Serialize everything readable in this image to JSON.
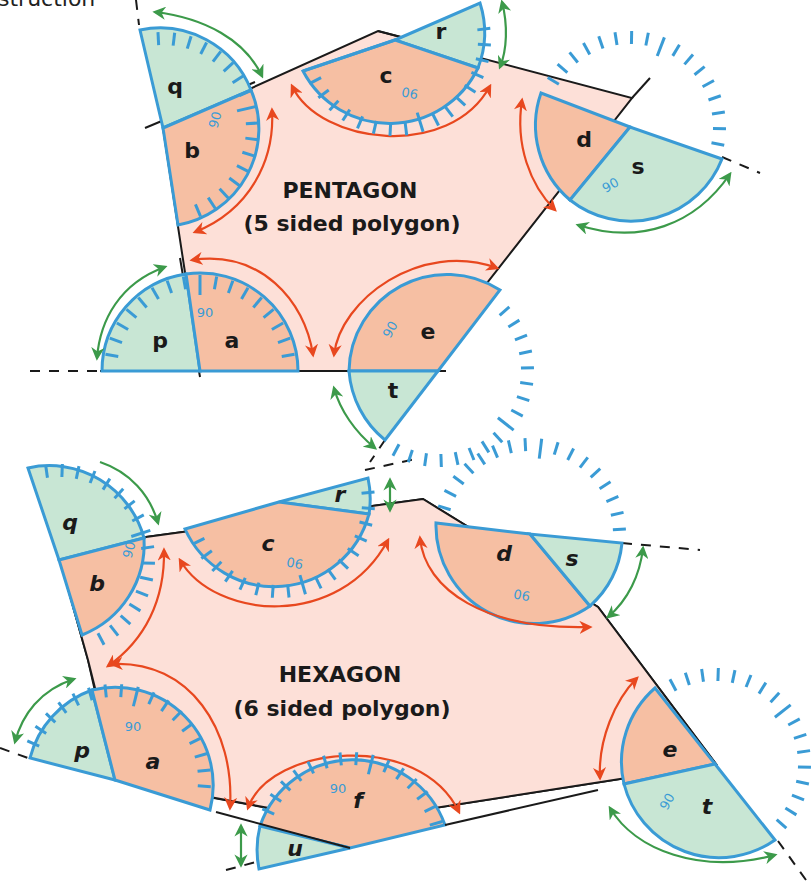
{
  "caption_fragment": "struction",
  "pentagon": {
    "title": "PENTAGON",
    "subtitle": "(5 sided polygon)",
    "interior_angles": [
      "a",
      "b",
      "c",
      "d",
      "e"
    ],
    "exterior_angles": [
      "p",
      "q",
      "r",
      "s",
      "t"
    ],
    "protractor_mark": "90"
  },
  "hexagon": {
    "title": "HEXAGON",
    "subtitle": "(6 sided polygon)",
    "interior_angles": [
      "a",
      "b",
      "c",
      "d",
      "e",
      "f"
    ],
    "exterior_angles": [
      "p",
      "q",
      "r",
      "s",
      "t",
      "u"
    ],
    "protractor_mark": "90"
  },
  "colors": {
    "polygon_fill": "#fde0d8",
    "interior_angle_fill": "#f6bfa3",
    "exterior_angle_fill": "#c8e6d4",
    "protractor_outline": "#3a9bd5",
    "interior_arrow": "#e8481f",
    "exterior_arrow": "#3c9a4a",
    "edge": "#1a1a1a"
  }
}
